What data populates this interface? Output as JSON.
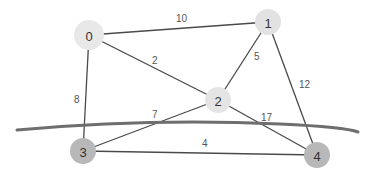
{
  "diagram": {
    "type": "weighted-graph-cut",
    "nodes": [
      {
        "id": "0",
        "label": "0",
        "x": 89,
        "y": 35,
        "r": 15,
        "fill": "#e8e8e8"
      },
      {
        "id": "1",
        "label": "1",
        "x": 268,
        "y": 22,
        "r": 13,
        "fill": "#e2e2e2"
      },
      {
        "id": "2",
        "label": "2",
        "x": 218,
        "y": 100,
        "r": 13,
        "fill": "#e4e4e4"
      },
      {
        "id": "3",
        "label": "3",
        "x": 83,
        "y": 151,
        "r": 13,
        "fill": "#b8b8b8"
      },
      {
        "id": "4",
        "label": "4",
        "x": 317,
        "y": 155,
        "r": 13,
        "fill": "#b8b8b8"
      }
    ],
    "edges": [
      {
        "from": "0",
        "to": "1",
        "weight": "10",
        "lx": 176,
        "ly": 22
      },
      {
        "from": "0",
        "to": "2",
        "weight": "2",
        "lx": 152,
        "ly": 64
      },
      {
        "from": "0",
        "to": "3",
        "weight": "8",
        "lx": 74,
        "ly": 103
      },
      {
        "from": "1",
        "to": "2",
        "weight": "5",
        "lx": 254,
        "ly": 60
      },
      {
        "from": "1",
        "to": "4",
        "weight": "12",
        "lx": 299,
        "ly": 88
      },
      {
        "from": "2",
        "to": "3",
        "weight": "7",
        "lx": 152,
        "ly": 118
      },
      {
        "from": "2",
        "to": "4",
        "weight": "17",
        "lx": 261,
        "ly": 121
      },
      {
        "from": "3",
        "to": "4",
        "weight": "4",
        "lx": 202,
        "ly": 147
      }
    ],
    "cut_line": {
      "color": "#6e6e6e",
      "description": "curved cut separating {0,1,2} from {3,4}"
    }
  }
}
